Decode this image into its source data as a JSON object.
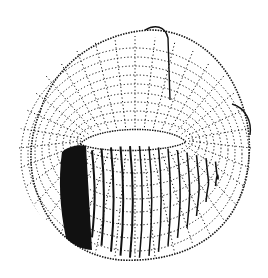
{
  "figure": {
    "colors": {
      "background": "#ffffff",
      "ink": "#111111"
    },
    "torus": {
      "center": [
        135,
        150
      ],
      "outer_rx": 118,
      "outer_ry": 112,
      "hole_center": [
        135,
        141
      ],
      "hole_rx": 52,
      "hole_ry": 14
    },
    "winding": {
      "start_x": 62,
      "end_x": 200,
      "turns": 14
    }
  }
}
